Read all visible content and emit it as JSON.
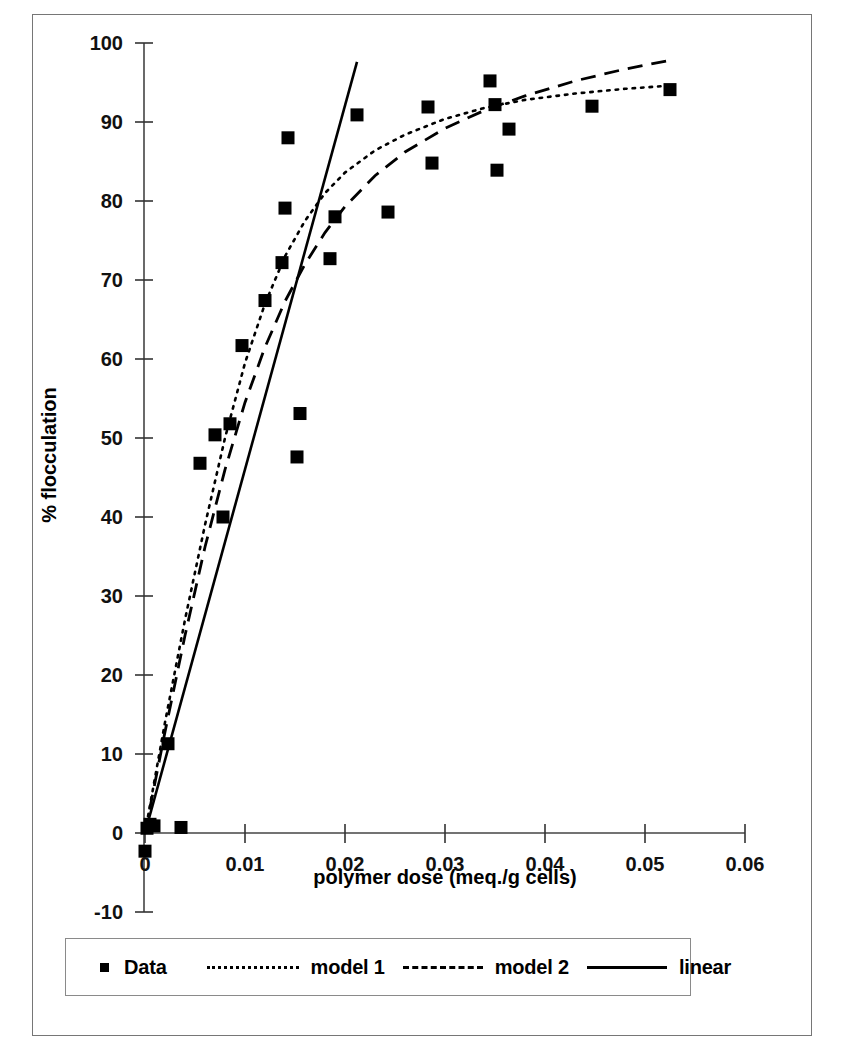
{
  "figure": {
    "has_outer_frame": true,
    "background_color": "#ffffff",
    "ink_color": "#000000"
  },
  "legend": {
    "position": "below-axes",
    "border_color": "#8a8a8a",
    "entries": [
      {
        "label": "Data",
        "style": "marker",
        "marker": "filled-square"
      },
      {
        "label": "model 1",
        "style": "dotted"
      },
      {
        "label": "model 2",
        "style": "dashed"
      },
      {
        "label": "linear",
        "style": "solid"
      }
    ]
  },
  "chart_data": {
    "type": "scatter",
    "title": "",
    "xlabel": "polymer dose (meq./g cells)",
    "ylabel": "% flocculation",
    "xlim": [
      0,
      0.06
    ],
    "ylim": [
      -10,
      100
    ],
    "xticks": [
      0,
      0.01,
      0.02,
      0.03,
      0.04,
      0.05,
      0.06
    ],
    "xticklabels": [
      "0",
      "0.01",
      "0.02",
      "0.03",
      "0.04",
      "0.05",
      "0.06"
    ],
    "yticks": [
      -10,
      0,
      10,
      20,
      30,
      40,
      50,
      60,
      70,
      80,
      90,
      100
    ],
    "yticklabels": [
      "-10",
      "0",
      "10",
      "20",
      "30",
      "40",
      "50",
      "60",
      "70",
      "80",
      "90",
      "100"
    ],
    "grid": false,
    "legend_position": "below",
    "series": [
      {
        "name": "Data",
        "type": "scatter",
        "marker": "filled-square",
        "color": "#000000",
        "points": [
          [
            0.0,
            -2.3
          ],
          [
            0.0002,
            0.6
          ],
          [
            0.0005,
            1.1
          ],
          [
            0.0009,
            0.9
          ],
          [
            0.0036,
            0.7
          ],
          [
            0.0023,
            11.3
          ],
          [
            0.0055,
            46.8
          ],
          [
            0.007,
            50.4
          ],
          [
            0.0078,
            40.0
          ],
          [
            0.0085,
            51.8
          ],
          [
            0.0097,
            61.7
          ],
          [
            0.012,
            67.4
          ],
          [
            0.0137,
            72.2
          ],
          [
            0.014,
            79.1
          ],
          [
            0.0143,
            88.0
          ],
          [
            0.0152,
            47.6
          ],
          [
            0.0155,
            53.1
          ],
          [
            0.0185,
            72.7
          ],
          [
            0.019,
            78.0
          ],
          [
            0.0212,
            90.9
          ],
          [
            0.0243,
            78.6
          ],
          [
            0.0283,
            91.9
          ],
          [
            0.0287,
            84.8
          ],
          [
            0.0345,
            95.2
          ],
          [
            0.035,
            92.2
          ],
          [
            0.0352,
            83.9
          ],
          [
            0.0364,
            89.1
          ],
          [
            0.0447,
            92.0
          ],
          [
            0.0525,
            94.1
          ]
        ]
      },
      {
        "name": "model 1",
        "type": "line",
        "style": "dotted",
        "color": "#000000",
        "points": [
          [
            0.0,
            0.0
          ],
          [
            0.002,
            14.0
          ],
          [
            0.004,
            27.0
          ],
          [
            0.006,
            39.0
          ],
          [
            0.008,
            50.0
          ],
          [
            0.01,
            59.5
          ],
          [
            0.012,
            67.0
          ],
          [
            0.014,
            73.0
          ],
          [
            0.016,
            77.5
          ],
          [
            0.018,
            81.0
          ],
          [
            0.02,
            83.6
          ],
          [
            0.023,
            86.4
          ],
          [
            0.026,
            88.4
          ],
          [
            0.03,
            90.4
          ],
          [
            0.034,
            91.8
          ],
          [
            0.038,
            92.8
          ],
          [
            0.043,
            93.6
          ],
          [
            0.048,
            94.2
          ],
          [
            0.0525,
            94.6
          ]
        ]
      },
      {
        "name": "model 2",
        "type": "line",
        "style": "dashed",
        "color": "#000000",
        "points": [
          [
            0.0,
            0.0
          ],
          [
            0.002,
            12.8
          ],
          [
            0.004,
            25.0
          ],
          [
            0.006,
            36.2
          ],
          [
            0.008,
            46.0
          ],
          [
            0.01,
            54.5
          ],
          [
            0.012,
            61.5
          ],
          [
            0.014,
            67.3
          ],
          [
            0.016,
            72.0
          ],
          [
            0.018,
            76.0
          ],
          [
            0.02,
            79.3
          ],
          [
            0.023,
            83.2
          ],
          [
            0.026,
            86.2
          ],
          [
            0.03,
            89.2
          ],
          [
            0.034,
            91.5
          ],
          [
            0.038,
            93.3
          ],
          [
            0.043,
            95.2
          ],
          [
            0.048,
            96.7
          ],
          [
            0.0525,
            97.8
          ]
        ]
      },
      {
        "name": "linear",
        "type": "line",
        "style": "solid",
        "color": "#000000",
        "points": [
          [
            0.0,
            0.0
          ],
          [
            0.0212,
            97.6
          ]
        ]
      }
    ]
  }
}
